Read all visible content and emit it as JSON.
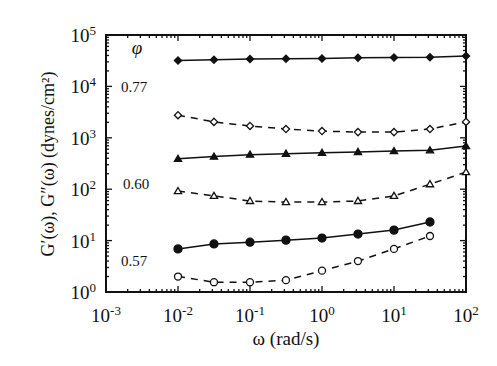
{
  "chart_data": {
    "type": "line",
    "title": "",
    "xlabel": "ω (rad/s)",
    "ylabel": "G′(ω), G″(ω) (dynes/cm²)",
    "xscale": "log",
    "yscale": "log",
    "xlim": [
      0.001,
      100
    ],
    "ylim": [
      1,
      100000
    ],
    "grid": false,
    "legend_title": "φ",
    "x_ticks": [
      {
        "base": "10",
        "exp": "-3",
        "value": 0.001
      },
      {
        "base": "10",
        "exp": "-2",
        "value": 0.01
      },
      {
        "base": "10",
        "exp": "-1",
        "value": 0.1
      },
      {
        "base": "10",
        "exp": "0",
        "value": 1
      },
      {
        "base": "10",
        "exp": "1",
        "value": 10
      },
      {
        "base": "10",
        "exp": "2",
        "value": 100
      }
    ],
    "y_ticks": [
      {
        "base": "10",
        "exp": "0",
        "value": 1
      },
      {
        "base": "10",
        "exp": "1",
        "value": 10
      },
      {
        "base": "10",
        "exp": "2",
        "value": 100
      },
      {
        "base": "10",
        "exp": "3",
        "value": 1000
      },
      {
        "base": "10",
        "exp": "4",
        "value": 10000
      },
      {
        "base": "10",
        "exp": "5",
        "value": 100000
      }
    ],
    "annotations": [
      {
        "text": "φ",
        "x": 137,
        "y": 54,
        "italic": true,
        "size": 19
      },
      {
        "text": "0.77",
        "x": 134,
        "y": 92,
        "italic": false,
        "size": 15
      },
      {
        "text": "0.60",
        "x": 136,
        "y": 189,
        "italic": false,
        "size": 15
      },
      {
        "text": "0.57",
        "x": 134,
        "y": 266,
        "italic": false,
        "size": 15
      }
    ],
    "series": [
      {
        "name": "G′ φ=0.77",
        "modulus": "storage",
        "phi": "0.77",
        "marker": "diamond",
        "filled": true,
        "line": "solid",
        "x": [
          0.01,
          0.0316,
          0.1,
          0.316,
          1,
          3.16,
          10,
          31.6,
          100
        ],
        "y": [
          32000,
          33000,
          34000,
          34500,
          35000,
          36000,
          36500,
          37000,
          39000
        ]
      },
      {
        "name": "G″ φ=0.77",
        "modulus": "loss",
        "phi": "0.77",
        "marker": "diamond",
        "filled": false,
        "line": "dashed",
        "x": [
          0.01,
          0.0316,
          0.1,
          0.316,
          1,
          3.16,
          10,
          31.6,
          100
        ],
        "y": [
          2750,
          2040,
          1700,
          1480,
          1350,
          1290,
          1290,
          1480,
          2040
        ]
      },
      {
        "name": "G′ φ=0.60",
        "modulus": "storage",
        "phi": "0.60",
        "marker": "triangle",
        "filled": true,
        "line": "solid",
        "x": [
          0.01,
          0.0316,
          0.1,
          0.316,
          1,
          3.16,
          10,
          31.6,
          100
        ],
        "y": [
          390,
          430,
          470,
          490,
          510,
          530,
          550,
          570,
          690
        ]
      },
      {
        "name": "G″ φ=0.60",
        "modulus": "loss",
        "phi": "0.60",
        "marker": "triangle",
        "filled": false,
        "line": "dashed",
        "x": [
          0.01,
          0.0316,
          0.1,
          0.316,
          1,
          3.16,
          10,
          31.6,
          100
        ],
        "y": [
          92,
          74,
          59,
          56,
          56,
          59,
          74,
          125,
          215
        ]
      },
      {
        "name": "G′ φ=0.57",
        "modulus": "storage",
        "phi": "0.57",
        "marker": "circle",
        "filled": true,
        "line": "solid",
        "x": [
          0.01,
          0.0316,
          0.1,
          0.316,
          1,
          3.16,
          10,
          31.6
        ],
        "y": [
          6.9,
          8.6,
          9.3,
          10.2,
          11.2,
          13.4,
          16,
          23
        ]
      },
      {
        "name": "G″ φ=0.57",
        "modulus": "loss",
        "phi": "0.57",
        "marker": "circle",
        "filled": false,
        "line": "dashed",
        "x": [
          0.01,
          0.0316,
          0.1,
          0.316,
          1,
          3.16,
          10,
          31.6
        ],
        "y": [
          2.0,
          1.55,
          1.55,
          1.7,
          2.6,
          4.0,
          6.9,
          12.3
        ]
      }
    ],
    "colors": {
      "ink": "#111111",
      "background": "#ffffff"
    }
  }
}
